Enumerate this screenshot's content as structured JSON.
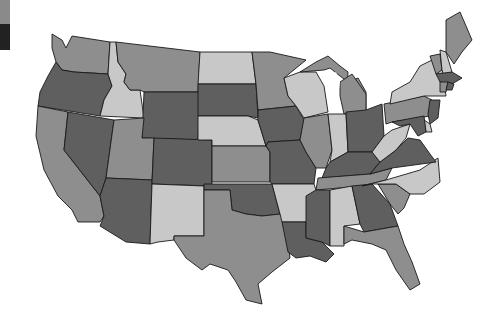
{
  "map": {
    "type": "choropleth",
    "region": "United States (contiguous)",
    "palette": {
      "light": "#c8c8c8",
      "mid": "#8e8e8e",
      "dark": "#5f5f5f",
      "border": "#1a1a1a",
      "water": "#ffffff"
    },
    "legend_swatches": [
      {
        "color": "#8a8a8a",
        "height": 24
      },
      {
        "color": "#222222",
        "height": 26
      }
    ],
    "states": [
      {
        "id": "WA",
        "shade": "mid"
      },
      {
        "id": "OR",
        "shade": "dark"
      },
      {
        "id": "CA",
        "shade": "mid"
      },
      {
        "id": "ID",
        "shade": "light"
      },
      {
        "id": "NV",
        "shade": "dark"
      },
      {
        "id": "MT",
        "shade": "mid"
      },
      {
        "id": "WY",
        "shade": "dark"
      },
      {
        "id": "UT",
        "shade": "mid"
      },
      {
        "id": "AZ",
        "shade": "dark"
      },
      {
        "id": "CO",
        "shade": "dark"
      },
      {
        "id": "NM",
        "shade": "light"
      },
      {
        "id": "ND",
        "shade": "light"
      },
      {
        "id": "SD",
        "shade": "dark"
      },
      {
        "id": "NE",
        "shade": "light"
      },
      {
        "id": "KS",
        "shade": "mid"
      },
      {
        "id": "OK",
        "shade": "dark"
      },
      {
        "id": "TX",
        "shade": "mid"
      },
      {
        "id": "MN",
        "shade": "mid"
      },
      {
        "id": "IA",
        "shade": "dark"
      },
      {
        "id": "MO",
        "shade": "dark"
      },
      {
        "id": "AR",
        "shade": "light"
      },
      {
        "id": "LA",
        "shade": "dark"
      },
      {
        "id": "WI",
        "shade": "light"
      },
      {
        "id": "IL",
        "shade": "mid"
      },
      {
        "id": "MI",
        "shade": "mid"
      },
      {
        "id": "IN",
        "shade": "light"
      },
      {
        "id": "OH",
        "shade": "dark"
      },
      {
        "id": "KY",
        "shade": "dark"
      },
      {
        "id": "TN",
        "shade": "mid"
      },
      {
        "id": "MS",
        "shade": "dark"
      },
      {
        "id": "AL",
        "shade": "light"
      },
      {
        "id": "GA",
        "shade": "dark"
      },
      {
        "id": "FL",
        "shade": "mid"
      },
      {
        "id": "SC",
        "shade": "mid"
      },
      {
        "id": "NC",
        "shade": "light"
      },
      {
        "id": "VA",
        "shade": "dark"
      },
      {
        "id": "WV",
        "shade": "light"
      },
      {
        "id": "PA",
        "shade": "mid"
      },
      {
        "id": "NY",
        "shade": "light"
      },
      {
        "id": "VT",
        "shade": "mid"
      },
      {
        "id": "NH",
        "shade": "light"
      },
      {
        "id": "ME",
        "shade": "mid"
      },
      {
        "id": "MA",
        "shade": "dark"
      },
      {
        "id": "CT",
        "shade": "mid"
      },
      {
        "id": "RI",
        "shade": "dark"
      },
      {
        "id": "NJ",
        "shade": "dark"
      },
      {
        "id": "DE",
        "shade": "light"
      },
      {
        "id": "MD",
        "shade": "dark"
      }
    ]
  }
}
